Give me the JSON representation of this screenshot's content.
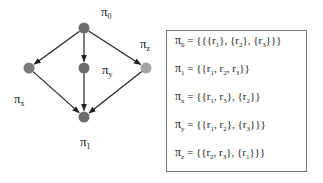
{
  "graph": {
    "nodes": [
      {
        "id": "pi0",
        "label": "π",
        "sub": "0",
        "x": 84,
        "y": 28,
        "color": "#6e6e6e",
        "lx": 101,
        "ly": 16
      },
      {
        "id": "pix",
        "label": "π",
        "sub": "x",
        "x": 29,
        "y": 68,
        "color": "#7a7a7a",
        "lx": 14,
        "ly": 103
      },
      {
        "id": "piy",
        "label": "π",
        "sub": "y",
        "x": 84,
        "y": 68,
        "color": "#6e6e6e",
        "lx": 102,
        "ly": 74
      },
      {
        "id": "piz",
        "label": "π",
        "sub": "z",
        "x": 146,
        "y": 68,
        "color": "#a5a5a5",
        "lx": 140,
        "ly": 48
      },
      {
        "id": "pi1",
        "label": "π",
        "sub": "1",
        "x": 84,
        "y": 117,
        "color": "#6e6e6e",
        "lx": 80,
        "ly": 146
      }
    ],
    "edges": [
      [
        "pi0",
        "pix"
      ],
      [
        "pi0",
        "piy"
      ],
      [
        "pi0",
        "piz"
      ],
      [
        "pix",
        "pi1"
      ],
      [
        "piy",
        "pi1"
      ],
      [
        "piz",
        "pi1"
      ]
    ]
  },
  "legend": {
    "rows": [
      {
        "sub": "0",
        "parts": [
          "{{{r",
          "1",
          "}, {r",
          "2",
          "}, {r",
          "3",
          "}}}"
        ]
      },
      {
        "sub": "1",
        "parts": [
          "{{r",
          "1",
          ", r",
          "2",
          ", r",
          "3",
          "}}"
        ]
      },
      {
        "sub": "x",
        "parts": [
          "{{r",
          "1",
          ", r",
          "3",
          "}, {r",
          "2",
          "}}"
        ]
      },
      {
        "sub": "y",
        "parts": [
          "{{r",
          "1",
          ", r",
          "2",
          "}, {r",
          "3",
          "}}}"
        ]
      },
      {
        "sub": "z",
        "parts": [
          "{{r",
          "2",
          ", r",
          "3",
          "}, {r",
          "1",
          "}}}"
        ]
      }
    ]
  }
}
